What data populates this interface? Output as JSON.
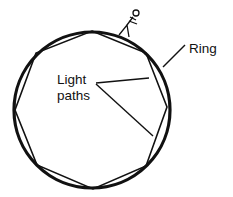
{
  "diagram": {
    "labels": {
      "ring": "Ring",
      "light_line1": "Light",
      "light_line2": "paths"
    },
    "ring": {
      "cx": 92,
      "cy": 110,
      "r": 78,
      "stroke_width": 3.2,
      "color": "#111111"
    },
    "polygon": {
      "sides": 8,
      "points": "92,31 146,53 167,107 146,166 93,189 37,165 15,110 36,53",
      "stroke_width": 1.6,
      "color": "#111111"
    },
    "observer": "stick-figure on ring"
  }
}
